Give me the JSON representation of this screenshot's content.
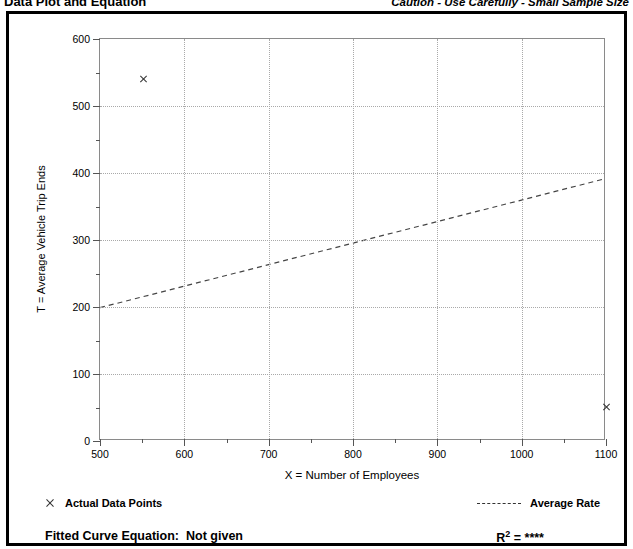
{
  "header": {
    "title": "Data Plot and Equation",
    "caution": "Caution - Use Carefully - Small Sample Size"
  },
  "chart_data": {
    "type": "scatter",
    "title": "Data Plot and Equation",
    "xlabel": "X = Number of Employees",
    "ylabel": "T = Average Vehicle Trip Ends",
    "xlim": [
      500,
      1100
    ],
    "ylim": [
      0,
      600
    ],
    "xticks": [
      500,
      600,
      700,
      800,
      900,
      1000,
      1100
    ],
    "yticks": [
      0,
      100,
      200,
      300,
      400,
      500,
      600
    ],
    "xminor_step": 50,
    "yminor_step": 50,
    "grid": true,
    "legend_position": "below-plot",
    "series": [
      {
        "name": "Actual Data Points",
        "type": "scatter",
        "marker": "x",
        "points": [
          {
            "x": 552,
            "y": 541
          },
          {
            "x": 1100,
            "y": 51
          }
        ]
      },
      {
        "name": "Average Rate",
        "type": "line",
        "style": "dashed",
        "points": [
          {
            "x": 500,
            "y": 197
          },
          {
            "x": 1100,
            "y": 390
          }
        ]
      }
    ]
  },
  "legend": {
    "actual_data_points": "Actual Data Points",
    "average_rate": "Average Rate"
  },
  "equation": {
    "fitted_label": "Fitted Curve Equation:",
    "fitted_value": "Not given",
    "r2_label": "R",
    "r2_exponent": "2",
    "r2_equals": "=",
    "r2_value": "****"
  }
}
